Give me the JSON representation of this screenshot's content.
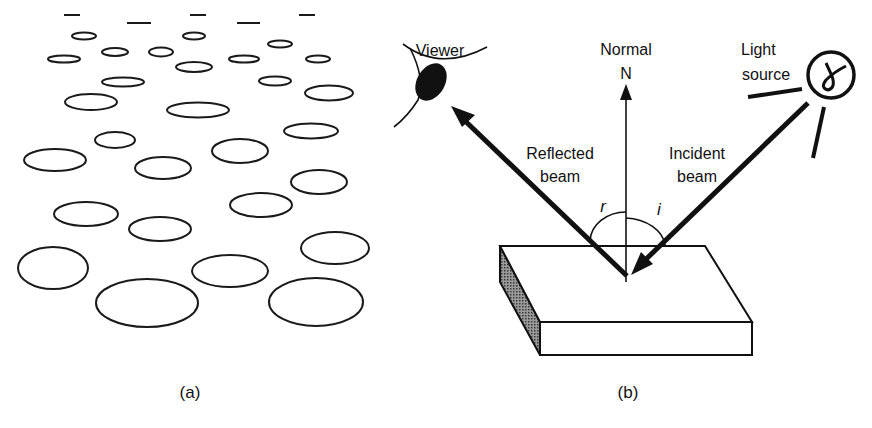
{
  "figure": {
    "panel_a": {
      "caption": "(a)",
      "description": "Field of ellipses in perspective, small and flat near the top (distant), large and rounder near the bottom (near)",
      "stroke_color": "#1a1a1a",
      "dashes": [
        {
          "x1": 64,
          "x2": 80,
          "y": 15
        },
        {
          "x1": 127,
          "x2": 151,
          "y": 23
        },
        {
          "x1": 190,
          "x2": 206,
          "y": 15
        },
        {
          "x1": 237,
          "x2": 260,
          "y": 23
        },
        {
          "x1": 299,
          "x2": 315,
          "y": 15
        }
      ],
      "ellipses": [
        {
          "cx": 84,
          "cy": 36,
          "rx": 12,
          "ry": 3.5
        },
        {
          "cx": 194,
          "cy": 36,
          "rx": 11,
          "ry": 3.5
        },
        {
          "cx": 280,
          "cy": 44,
          "rx": 12,
          "ry": 3.5
        },
        {
          "cx": 115,
          "cy": 52,
          "rx": 13,
          "ry": 4
        },
        {
          "cx": 161,
          "cy": 52,
          "rx": 12,
          "ry": 4.5
        },
        {
          "cx": 64,
          "cy": 59,
          "rx": 16,
          "ry": 3.5
        },
        {
          "cx": 244,
          "cy": 59,
          "rx": 15,
          "ry": 3.5
        },
        {
          "cx": 318,
          "cy": 59,
          "rx": 12,
          "ry": 3.5
        },
        {
          "cx": 194,
          "cy": 67,
          "rx": 18,
          "ry": 5
        },
        {
          "cx": 123,
          "cy": 82,
          "rx": 21,
          "ry": 4.5
        },
        {
          "cx": 275,
          "cy": 81,
          "rx": 16,
          "ry": 4.5
        },
        {
          "cx": 91,
          "cy": 102,
          "rx": 26,
          "ry": 8
        },
        {
          "cx": 329,
          "cy": 93,
          "rx": 24,
          "ry": 7.5
        },
        {
          "cx": 198,
          "cy": 110,
          "rx": 31,
          "ry": 7.5
        },
        {
          "cx": 311,
          "cy": 131,
          "rx": 27,
          "ry": 7.5
        },
        {
          "cx": 115,
          "cy": 140,
          "rx": 20,
          "ry": 8
        },
        {
          "cx": 240,
          "cy": 151,
          "rx": 28,
          "ry": 12
        },
        {
          "cx": 55,
          "cy": 160,
          "rx": 31,
          "ry": 11
        },
        {
          "cx": 163,
          "cy": 168,
          "rx": 28,
          "ry": 11
        },
        {
          "cx": 319,
          "cy": 182,
          "rx": 28,
          "ry": 12
        },
        {
          "cx": 261,
          "cy": 205,
          "rx": 31,
          "ry": 12
        },
        {
          "cx": 86,
          "cy": 214,
          "rx": 32,
          "ry": 12
        },
        {
          "cx": 160,
          "cy": 229,
          "rx": 31,
          "ry": 12
        },
        {
          "cx": 335,
          "cy": 248,
          "rx": 34,
          "ry": 16
        },
        {
          "cx": 53,
          "cy": 268,
          "rx": 35,
          "ry": 21
        },
        {
          "cx": 230,
          "cy": 271,
          "rx": 38,
          "ry": 16
        },
        {
          "cx": 147,
          "cy": 303,
          "rx": 51,
          "ry": 24
        },
        {
          "cx": 316,
          "cy": 302,
          "rx": 47,
          "ry": 24
        }
      ]
    },
    "panel_b": {
      "caption": "(b)",
      "labels": {
        "viewer": "Viewer",
        "normal": "Normal",
        "normal_symbol": "N",
        "light_line1": "Light",
        "light_line2": "source",
        "reflected_line1": "Reflected",
        "reflected_line2": "beam",
        "incident_line1": "Incident",
        "incident_line2": "beam",
        "angle_reflection": "r",
        "angle_incidence": "i"
      },
      "icons": {
        "viewer": "eye-icon",
        "light": "light-bulb-icon"
      },
      "colors": {
        "ink": "#111111",
        "shade": "#6b6b6b"
      }
    }
  }
}
